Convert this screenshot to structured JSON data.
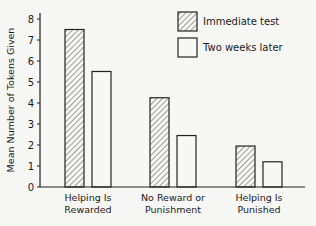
{
  "chart_data": {
    "type": "bar",
    "title": "",
    "xlabel": "",
    "ylabel": "Mean Number of Tokens Given",
    "ylim": [
      0,
      8
    ],
    "yticks": [
      0,
      1,
      2,
      3,
      4,
      5,
      6,
      7,
      8
    ],
    "categories": [
      [
        "Helping Is",
        "Rewarded"
      ],
      [
        "No Reward or",
        "Punishment"
      ],
      [
        "Helping Is",
        "Punished"
      ]
    ],
    "category_names": [
      "Helping Is Rewarded",
      "No Reward or Punishment",
      "Helping Is Punished"
    ],
    "series": [
      {
        "name": "Immediate test",
        "pattern": "hatched",
        "values": [
          7.5,
          4.25,
          1.95
        ]
      },
      {
        "name": "Two weeks later",
        "pattern": "open",
        "values": [
          5.5,
          2.45,
          1.2
        ]
      }
    ],
    "grid": false,
    "legend_position": "top-right"
  },
  "legend": {
    "items": [
      {
        "label": "Immediate test"
      },
      {
        "label": "Two weeks later"
      }
    ]
  }
}
